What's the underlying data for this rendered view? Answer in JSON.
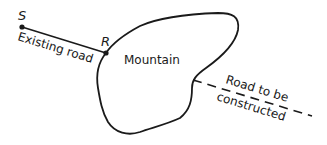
{
  "diagram": {
    "labels": {
      "start_point": "S",
      "junction_point": "R",
      "existing_road": "Existing road",
      "mountain": "Mountain",
      "new_road_line1": "Road to be",
      "new_road_line2": "constructed"
    },
    "colors": {
      "ink": "#1a1a1a",
      "background": "#ffffff"
    }
  }
}
